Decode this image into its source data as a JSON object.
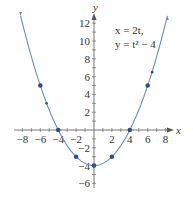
{
  "chart_data": {
    "type": "line",
    "title": "",
    "xlabel": "x",
    "ylabel": "y",
    "xlim": [
      -8,
      8
    ],
    "ylim": [
      -6,
      12
    ],
    "x_ticks": [
      -8,
      -6,
      -4,
      -2,
      2,
      4,
      6,
      8
    ],
    "y_ticks": [
      12,
      10,
      8,
      6,
      4,
      2,
      -2,
      -4,
      -6
    ],
    "x_tick_labels": [
      "−8",
      "−6",
      "−4",
      "−2",
      "2",
      "4",
      "6",
      "8"
    ],
    "y_tick_labels": [
      "12",
      "10",
      "8",
      "6",
      "4",
      "2",
      "−2",
      "−4",
      "−6"
    ],
    "grid": false,
    "annotation": {
      "line1": "x = 2t,",
      "line2": "y = t² − 4"
    },
    "series": [
      {
        "name": "parametric curve x=2t, y=t^2-4",
        "type": "line",
        "color": "#6f8fb5",
        "t_range": [
          -4.1,
          4.1
        ]
      },
      {
        "name": "marked points",
        "type": "scatter",
        "color": "#2f4e8c",
        "points": [
          {
            "t": -3,
            "x": -6,
            "y": 5
          },
          {
            "t": -2,
            "x": -4,
            "y": 0
          },
          {
            "t": -1,
            "x": -2,
            "y": -3
          },
          {
            "t": 0,
            "x": 0,
            "y": -4
          },
          {
            "t": 1,
            "x": 2,
            "y": -3
          },
          {
            "t": 2,
            "x": 4,
            "y": 0
          },
          {
            "t": 3,
            "x": 6,
            "y": 5
          }
        ]
      }
    ],
    "direction_arrows": [
      {
        "x": -5.3,
        "y": 3.0
      },
      {
        "x": 6.5,
        "y": 6.5
      }
    ]
  }
}
